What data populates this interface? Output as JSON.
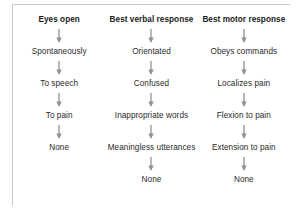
{
  "figure": {
    "frame_color": "#c9cdd1",
    "arrow_color": "#8d9094",
    "header_color": "#1b1b1b",
    "node_color": "#2a2a2a",
    "arrow_icon": "down-arrow-icon"
  },
  "columns": [
    {
      "header": "Eyes open",
      "items": [
        "Spontaneously",
        "To speech",
        "To pain",
        "None"
      ]
    },
    {
      "header": "Best verbal response",
      "items": [
        "Orientated",
        "Confused",
        "Inappropriate words",
        "Meaningless utterances",
        "None"
      ]
    },
    {
      "header": "Best motor response",
      "items": [
        "Obeys commands",
        "Localizes pain",
        "Flexion to pain",
        "Extension to pain",
        "None"
      ]
    }
  ]
}
